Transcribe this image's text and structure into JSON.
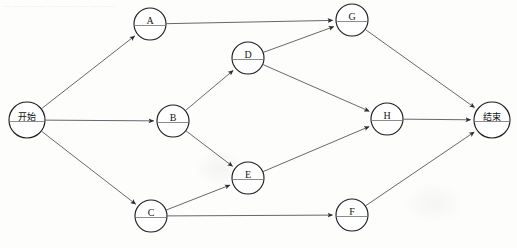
{
  "diagram": {
    "type": "directed-graph",
    "title": "",
    "bleed_text": "一一一一一一一一一一一一一",
    "nodes": [
      {
        "id": "start",
        "label": "开始",
        "cx": 27,
        "cy": 120,
        "r": 18,
        "cjk": true
      },
      {
        "id": "A",
        "label": "A",
        "cx": 150,
        "cy": 24,
        "r": 16,
        "cjk": false
      },
      {
        "id": "B",
        "label": "B",
        "cx": 173,
        "cy": 121,
        "r": 16,
        "cjk": false
      },
      {
        "id": "C",
        "label": "C",
        "cx": 151,
        "cy": 216,
        "r": 16,
        "cjk": false
      },
      {
        "id": "D",
        "label": "D",
        "cx": 248,
        "cy": 58,
        "r": 16,
        "cjk": false
      },
      {
        "id": "E",
        "label": "E",
        "cx": 248,
        "cy": 178,
        "r": 16,
        "cjk": false
      },
      {
        "id": "G",
        "label": "G",
        "cx": 352,
        "cy": 20,
        "r": 16,
        "cjk": false
      },
      {
        "id": "H",
        "label": "H",
        "cx": 387,
        "cy": 119,
        "r": 16,
        "cjk": false
      },
      {
        "id": "F",
        "label": "F",
        "cx": 352,
        "cy": 215,
        "r": 16,
        "cjk": false
      },
      {
        "id": "end",
        "label": "结束",
        "cx": 492,
        "cy": 120,
        "r": 18,
        "cjk": true
      }
    ],
    "edges": [
      {
        "from": "start",
        "to": "A"
      },
      {
        "from": "start",
        "to": "B"
      },
      {
        "from": "start",
        "to": "C"
      },
      {
        "from": "A",
        "to": "G"
      },
      {
        "from": "B",
        "to": "D"
      },
      {
        "from": "B",
        "to": "E"
      },
      {
        "from": "C",
        "to": "E"
      },
      {
        "from": "C",
        "to": "F"
      },
      {
        "from": "D",
        "to": "G"
      },
      {
        "from": "D",
        "to": "H"
      },
      {
        "from": "E",
        "to": "H"
      },
      {
        "from": "G",
        "to": "end"
      },
      {
        "from": "H",
        "to": "end"
      },
      {
        "from": "F",
        "to": "end"
      }
    ],
    "colors": {
      "node_stroke": "#1d1d20",
      "node_fill": "#ffffff",
      "edge_stroke": "#4d4d52",
      "label_color": "#15151a",
      "background": "#fdfdfc"
    }
  }
}
